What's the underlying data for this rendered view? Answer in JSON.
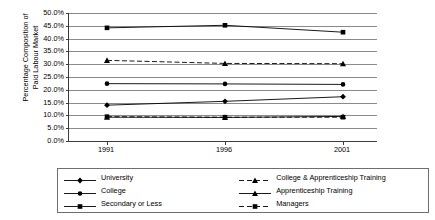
{
  "chart_data": {
    "type": "line",
    "title": "",
    "xlabel": "",
    "ylabel": "Percentage Composition of\nPaid Labour Market",
    "categories": [
      "1991",
      "1996",
      "2001"
    ],
    "x_tick_labels": [
      "1991",
      "1996",
      "2001"
    ],
    "y_tick_labels": [
      "0.0%",
      "5.0%",
      "10.0%",
      "15.0%",
      "20.0%",
      "25.0%",
      "30.0%",
      "35.0%",
      "40.0%",
      "45.0%",
      "50.0%"
    ],
    "y_tick_values": [
      0,
      5,
      10,
      15,
      20,
      25,
      30,
      35,
      40,
      45,
      50
    ],
    "ylim": [
      0,
      50
    ],
    "grid": true,
    "legend_position": "bottom",
    "series": [
      {
        "name": "University",
        "values": [
          14.0,
          15.5,
          17.3
        ],
        "marker": "diamond",
        "linestyle": "solid",
        "color": "#000000"
      },
      {
        "name": "College",
        "values": [
          22.4,
          22.3,
          22.1
        ],
        "marker": "circle",
        "linestyle": "solid",
        "color": "#000000"
      },
      {
        "name": "Secondary or Less",
        "values": [
          44.2,
          45.2,
          42.5
        ],
        "marker": "square",
        "linestyle": "solid",
        "color": "#000000"
      },
      {
        "name": "College & Apprenticeship Training",
        "values": [
          31.5,
          30.3,
          30.2
        ],
        "marker": "triangle",
        "linestyle": "dashed",
        "color": "#000000"
      },
      {
        "name": "Apprenticeship Training",
        "values": [
          9.3,
          9.2,
          9.6
        ],
        "marker": "triangle",
        "linestyle": "solid",
        "color": "#000000"
      },
      {
        "name": "Managers",
        "values": [
          9.5,
          9.3,
          9.3
        ],
        "marker": "square",
        "linestyle": "dashed",
        "color": "#000000"
      }
    ]
  },
  "legend": {
    "items": [
      {
        "label": "University"
      },
      {
        "label": "College & Apprenticeship Training"
      },
      {
        "label": "College"
      },
      {
        "label": "Apprenticeship Training"
      },
      {
        "label": "Secondary or Less"
      },
      {
        "label": "Managers"
      }
    ]
  },
  "colors": {
    "axis": "#3c3c3c",
    "grid": "#8a8a8a",
    "series": "#000000",
    "legend_border": "#6e6e6e",
    "background": "#ffffff"
  }
}
